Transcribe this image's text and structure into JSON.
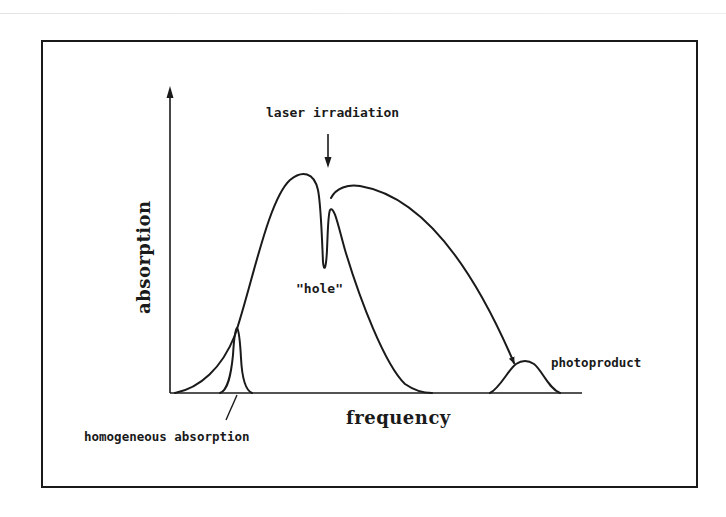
{
  "figure": {
    "axes": {
      "y_label": "absorption",
      "x_label": "frequency"
    },
    "annotations": {
      "laser": "laser irradiation",
      "hole": "\"hole\"",
      "homogeneous": "homogeneous absorption",
      "photoproduct": "photoproduct"
    },
    "elements": [
      {
        "name": "inhomogeneous-band",
        "description": "broad inhomogeneously broadened absorption band"
      },
      {
        "name": "spectral-hole",
        "description": "narrow dip burned at laser frequency"
      },
      {
        "name": "homogeneous-line",
        "description": "narrow homogeneous absorption line"
      },
      {
        "name": "photoproduct-band",
        "description": "new absorption band of photoproduct"
      },
      {
        "name": "transfer-arrow",
        "description": "curved arrow from hole to photoproduct"
      }
    ],
    "colors": {
      "ink": "#1a1a1a",
      "background": "#ffffff"
    }
  }
}
